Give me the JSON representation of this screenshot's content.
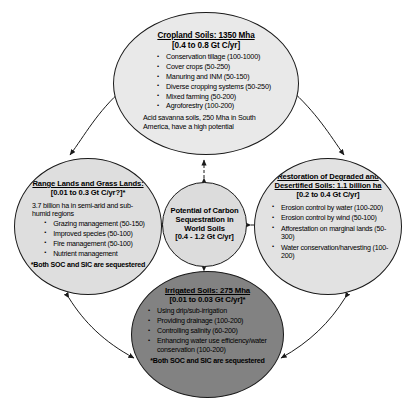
{
  "diagram": {
    "center": {
      "lines": [
        "Potential of Carbon",
        "Sequestration in",
        "World Soils",
        "[0.4 - 1.2 Gt C/yr]"
      ],
      "fill": "#dcdcdc"
    },
    "nodes": {
      "cropland": {
        "title": "Cropland Soils: 1350 Mha",
        "subtitle": "[0.4 to 0.8 Gt C/yr]",
        "bullets": [
          "Conservation tillage (100-1000)",
          "Cover crops (50-250)",
          "Manuring and INM (50-150)",
          "Diverse cropping systems (50-250)",
          "Mixed farming (50-200)",
          "Agroforestry (100-200)"
        ],
        "note": "Acid savanna soils, 250 Mha in South America, have a high potential",
        "fill": "#e9e9e9"
      },
      "range": {
        "title": "Range Lands and Grass Lands:",
        "subtitle": "[0.01 to 0.3 Gt C/yr?]*",
        "note": "3.7 billion ha in semi-arid and sub-humid regions",
        "bullets": [
          "Grazing management (50-150)",
          "Improved species (50-100)",
          "Fire management (50-100)",
          "Nutrient management"
        ],
        "footnote": "*Both SOC and SIC are sequestered",
        "fill": "#dedede"
      },
      "restoration": {
        "title": "Restoration of Degraded and Desertified Soils: 1.1 billion ha",
        "subtitle": "[0.2 to 0.4 Gt C/yr]",
        "bullets": [
          "Erosion control by water (100-200)",
          "Erosion control by wind (50-100)",
          "Afforestation on marginal lands (50-300)",
          "Water conservation/harvesting (100-200)"
        ],
        "fill": "#e2e2e2"
      },
      "irrigated": {
        "title": "Irrigated Soils: 275 Mha",
        "subtitle": "[0.01 to 0.03 Gt C/yr]*",
        "bullets": [
          "Using drip/sub-irrigation",
          "Providing drainage (100-200)",
          "Controlling salinity (60-200)",
          "Enhancing water use efficiency/water conservation (100-200)"
        ],
        "footnote": "*Both SOC and SIC are sequestered",
        "fill": "#828282"
      }
    },
    "connector_color": "#1a1a1a"
  }
}
